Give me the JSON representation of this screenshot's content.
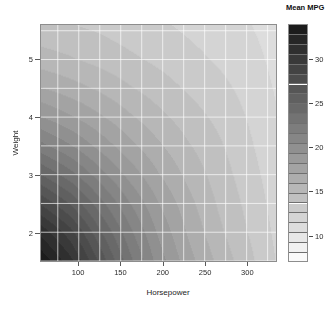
{
  "figure": {
    "background": "#ffffff",
    "panel_border": "#8d8d8d"
  },
  "axes": {
    "x_title": "Horsepower",
    "y_title": "Weight"
  },
  "legend": {
    "title": "Mean MPG",
    "ticks": [
      {
        "value": 30,
        "label": "30"
      },
      {
        "value": 25,
        "label": "25"
      },
      {
        "value": 20,
        "label": "20"
      },
      {
        "value": 15,
        "label": "15"
      },
      {
        "value": 10,
        "label": "10"
      }
    ]
  },
  "chart_data": {
    "type": "heatmap",
    "title": "",
    "subtitle": "",
    "xlabel": "Horsepower",
    "ylabel": "Weight",
    "zlabel": "Mean MPG",
    "colormap": "grayscale-inverted",
    "colormap_note": "dark = high Mean MPG, light = low Mean MPG",
    "grid": true,
    "grid_color": "#ffffff",
    "legend_position": "right",
    "xlim": [
      55,
      335
    ],
    "ylim": [
      1.5,
      5.6
    ],
    "zlim": [
      7,
      34
    ],
    "xticks": [
      100,
      150,
      200,
      250,
      300
    ],
    "xtick_labels": [
      "100",
      "150",
      "200",
      "250",
      "300"
    ],
    "yticks": [
      2,
      3,
      4,
      5
    ],
    "ytick_labels": [
      "2",
      "3",
      "4",
      "5"
    ],
    "zticks": [
      10,
      15,
      20,
      25,
      30
    ],
    "ztick_labels": [
      "10",
      "15",
      "20",
      "25",
      "30"
    ],
    "n_levels": 24,
    "level_breaks": [
      7,
      8.125,
      9.25,
      10.375,
      11.5,
      12.625,
      13.75,
      14.875,
      16,
      17.125,
      18.25,
      19.375,
      20.5,
      21.625,
      22.75,
      23.875,
      25,
      26.125,
      27.25,
      28.375,
      29.5,
      30.625,
      31.75,
      32.875,
      34
    ],
    "x": [
      55,
      90,
      125,
      160,
      195,
      230,
      265,
      300,
      335
    ],
    "y": [
      1.5,
      2.0,
      2.5,
      3.0,
      3.5,
      4.0,
      4.5,
      5.0,
      5.6
    ],
    "z_grid": [
      [
        33.8,
        31.0,
        27.0,
        23.2,
        20.0,
        17.6,
        15.8,
        14.2,
        12.6
      ],
      [
        31.4,
        28.8,
        25.2,
        22.0,
        19.2,
        17.0,
        15.2,
        13.8,
        12.4
      ],
      [
        28.2,
        26.0,
        23.2,
        20.6,
        18.3,
        16.4,
        14.8,
        13.5,
        12.2
      ],
      [
        25.0,
        23.2,
        21.0,
        19.0,
        17.2,
        15.7,
        14.4,
        13.2,
        12.0
      ],
      [
        22.0,
        20.6,
        19.0,
        17.5,
        16.2,
        15.0,
        14.0,
        12.9,
        11.8
      ],
      [
        19.4,
        18.4,
        17.3,
        16.2,
        15.2,
        14.3,
        13.5,
        12.6,
        11.6
      ],
      [
        17.2,
        16.5,
        15.8,
        15.0,
        14.3,
        13.6,
        13.0,
        12.3,
        11.4
      ],
      [
        15.4,
        15.0,
        14.5,
        14.0,
        13.5,
        13.0,
        12.5,
        12.0,
        11.2
      ],
      [
        14.0,
        13.8,
        13.5,
        13.1,
        12.8,
        12.4,
        12.0,
        11.6,
        11.0
      ]
    ],
    "z_grid_note": "rows correspond to y (Weight) ascending; columns to x (Horsepower) ascending",
    "annotations": [
      "Darkest region (highest Mean MPG, ~34) at low Horsepower and low Weight (bottom-left).",
      "Lightest region (lowest Mean MPG, ~10) at high Horsepower (right edge) and at high Weight with low Horsepower (top-left).",
      "Contour bands curve concentrically outward from the bottom-left corner."
    ]
  }
}
